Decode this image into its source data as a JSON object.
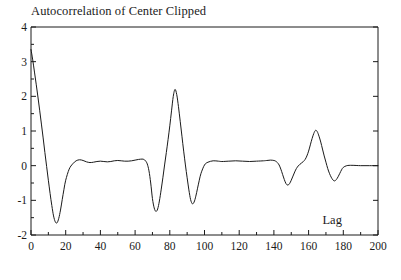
{
  "chart_data": {
    "type": "line",
    "title": "Autocorrelation of Center Clipped",
    "xlabel": "Lag",
    "ylabel": "",
    "xlim": [
      0,
      200
    ],
    "ylim": [
      -2,
      4
    ],
    "grid": false,
    "legend": null,
    "x_ticks": [
      0,
      20,
      40,
      60,
      80,
      100,
      120,
      140,
      160,
      180,
      200
    ],
    "x_tick_labels": [
      "0",
      "20",
      "40",
      "60",
      "80",
      "100",
      "120",
      "140",
      "160",
      "180",
      "200"
    ],
    "x_minor_tick_step": 10,
    "y_ticks": [
      -2,
      -1,
      0,
      1,
      2,
      3,
      4
    ],
    "y_tick_labels": [
      "-2",
      "-1",
      "0",
      "1",
      "2",
      "3",
      "4"
    ],
    "y_minor_tick_step": 0.5,
    "line_color": "#1a1a1a",
    "line_width": 1.0,
    "series": [
      {
        "name": "Autocorrelation of Center Clipped",
        "x": [
          0,
          1,
          2,
          3,
          4,
          5,
          6,
          7,
          8,
          9,
          10,
          11,
          12,
          13,
          14,
          15,
          16,
          17,
          18,
          19,
          20,
          22,
          24,
          26,
          28,
          30,
          32,
          34,
          36,
          38,
          40,
          42,
          44,
          46,
          48,
          50,
          52,
          54,
          56,
          58,
          60,
          62,
          64,
          65,
          66,
          67,
          68,
          69,
          70,
          71,
          72,
          73,
          74,
          75,
          76,
          77,
          78,
          79,
          80,
          81,
          82,
          83,
          84,
          85,
          86,
          87,
          88,
          89,
          90,
          91,
          92,
          93,
          94,
          95,
          96,
          97,
          98,
          100,
          102,
          105,
          108,
          110,
          114,
          118,
          122,
          126,
          130,
          134,
          136,
          138,
          140,
          141,
          142,
          143,
          144,
          145,
          146,
          147,
          148,
          149,
          150,
          151,
          152,
          153,
          154,
          155,
          156,
          157,
          158,
          159,
          160,
          161,
          162,
          163,
          164,
          165,
          166,
          167,
          168,
          169,
          170,
          171,
          172,
          173,
          174,
          175,
          176,
          177,
          178,
          179,
          180,
          182,
          185,
          190,
          195,
          200
        ],
        "values": [
          3.35,
          3.05,
          2.7,
          2.35,
          1.98,
          1.6,
          1.2,
          0.8,
          0.38,
          -0.02,
          -0.42,
          -0.8,
          -1.15,
          -1.45,
          -1.62,
          -1.65,
          -1.52,
          -1.28,
          -0.98,
          -0.68,
          -0.42,
          -0.1,
          0.05,
          0.14,
          0.17,
          0.15,
          0.11,
          0.09,
          0.1,
          0.12,
          0.13,
          0.12,
          0.11,
          0.12,
          0.14,
          0.15,
          0.14,
          0.13,
          0.13,
          0.14,
          0.16,
          0.18,
          0.19,
          0.18,
          0.14,
          0.05,
          -0.15,
          -0.5,
          -0.95,
          -1.22,
          -1.32,
          -1.25,
          -1.02,
          -0.7,
          -0.35,
          0.02,
          0.38,
          0.75,
          1.15,
          1.58,
          2.0,
          2.2,
          2.05,
          1.7,
          1.28,
          0.85,
          0.42,
          0.02,
          -0.35,
          -0.7,
          -0.98,
          -1.1,
          -1.05,
          -0.88,
          -0.65,
          -0.42,
          -0.22,
          0.02,
          0.1,
          0.14,
          0.13,
          0.12,
          0.13,
          0.14,
          0.13,
          0.12,
          0.13,
          0.14,
          0.15,
          0.16,
          0.15,
          0.13,
          0.09,
          0.02,
          -0.1,
          -0.25,
          -0.4,
          -0.52,
          -0.56,
          -0.52,
          -0.42,
          -0.3,
          -0.18,
          -0.08,
          -0.01,
          0.04,
          0.08,
          0.12,
          0.18,
          0.28,
          0.42,
          0.6,
          0.78,
          0.93,
          1.02,
          0.98,
          0.85,
          0.68,
          0.48,
          0.28,
          0.1,
          -0.08,
          -0.22,
          -0.33,
          -0.41,
          -0.44,
          -0.4,
          -0.32,
          -0.22,
          -0.12,
          -0.05,
          0.0,
          0.01,
          0.0,
          0.0,
          0.0
        ]
      }
    ]
  },
  "axes": {
    "x_title": "Lag"
  }
}
